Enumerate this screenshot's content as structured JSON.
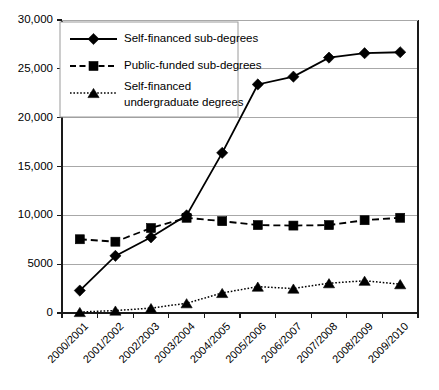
{
  "chart_data": {
    "type": "line",
    "title": "",
    "subtitle": "",
    "xlabel": "",
    "ylabel": "",
    "ylim": [
      0,
      30000
    ],
    "ytick_values": [
      0,
      5000,
      10000,
      15000,
      20000,
      25000,
      30000
    ],
    "ytick_labels": [
      "0",
      "5000",
      "10,000",
      "15,000",
      "20,000",
      "25,000",
      "30,000"
    ],
    "grid": true,
    "grid_axis": "y",
    "legend_position": "top-left",
    "categories": [
      "2000/2001",
      "2001/2002",
      "2002/2003",
      "2003/2004",
      "2004/2005",
      "2005/2006",
      "2006/2007",
      "2007/2008",
      "2008/2009",
      "2009/2010"
    ],
    "series": [
      {
        "name": "Self-financed sub-degrees",
        "marker": "diamond",
        "line_style": "solid",
        "color": "#000000",
        "values": [
          2300,
          5850,
          7750,
          10000,
          16400,
          23400,
          24200,
          26150,
          26600,
          26700
        ]
      },
      {
        "name": "Public-funded sub-degrees",
        "marker": "square",
        "line_style": "dashed",
        "color": "#000000",
        "values": [
          7550,
          7300,
          8700,
          9750,
          9400,
          9000,
          8950,
          9000,
          9500,
          9750
        ]
      },
      {
        "name": "Self-financed undergraduate degrees",
        "marker": "triangle",
        "line_style": "dotted",
        "color": "#000000",
        "values": [
          100,
          250,
          500,
          1000,
          2050,
          2700,
          2500,
          3050,
          3300,
          2950
        ]
      }
    ]
  },
  "legend": {
    "entries": [
      {
        "label": "Self-financed sub-degrees",
        "label_line2": ""
      },
      {
        "label": "Public-funded sub-degrees",
        "label_line2": ""
      },
      {
        "label": "Self-financed",
        "label_line2": "undergraduate degrees"
      }
    ]
  },
  "colors": {
    "ink": "#000000",
    "grid": "#a8a8a8",
    "legend_border": "#9a9a9a",
    "background": "#ffffff"
  }
}
